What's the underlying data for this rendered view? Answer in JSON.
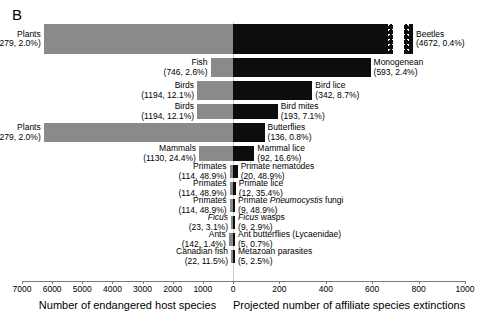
{
  "panel": {
    "letter": "B"
  },
  "chart_data": {
    "type": "bar",
    "title": "",
    "subtitle": "",
    "orientation": "horizontal-diverging",
    "xlabel_left": "Number of endangered host species",
    "xlabel_right": "Projected number of affiliate species extinctions",
    "ylabel": "",
    "grid": false,
    "legend": "none",
    "axis_left": {
      "label": "Number of endangered host species",
      "ticks": [
        7000,
        6000,
        5000,
        4000,
        3000,
        2000,
        1000,
        0
      ],
      "tick_labels": [
        "7000",
        "6000",
        "5000",
        "4000",
        "3000",
        "2000",
        "1000",
        "0"
      ],
      "range": [
        7000,
        0
      ],
      "direction": "decreasing"
    },
    "axis_right": {
      "label": "Projected number of affiliate species extinctions",
      "ticks": [
        0,
        200,
        400,
        600,
        800,
        1000
      ],
      "tick_labels": [
        "0",
        "200",
        "400",
        "600",
        "800",
        "1000"
      ],
      "range": [
        0,
        1000
      ],
      "direction": "increasing",
      "has_axis_break": true,
      "break_note": "Top bar (Beetles) is truncated with an axis break; true value 4672"
    },
    "colors": {
      "host_bar": "#8a8a8a",
      "affiliate_bar": "#0d0d0d",
      "axis": "#7b7b7b"
    },
    "rows": [
      {
        "host_name": "Plants",
        "host_value": 6279,
        "host_percent": "2.0%",
        "host_label": "Plants",
        "host_sub": "(6279, 2.0%)",
        "affiliate_name": "Beetles",
        "affiliate_value": 4672,
        "affiliate_percent": "0.4%",
        "affiliate_label": "Beetles",
        "affiliate_sub": "(4672, 0.4%)",
        "broken": true
      },
      {
        "host_name": "Fish",
        "host_value": 746,
        "host_percent": "2.6%",
        "host_label": "Fish",
        "host_sub": "(746, 2.6%)",
        "affiliate_name": "Monogenean",
        "affiliate_value": 593,
        "affiliate_percent": "2.4%",
        "affiliate_label": "Monogenean",
        "affiliate_sub": "(593, 2.4%)",
        "broken": false
      },
      {
        "host_name": "Birds",
        "host_value": 1194,
        "host_percent": "12.1%",
        "host_label": "Birds",
        "host_sub": "(1194, 12.1%)",
        "affiliate_name": "Bird lice",
        "affiliate_value": 342,
        "affiliate_percent": "8.7%",
        "affiliate_label": "Bird lice",
        "affiliate_sub": "(342, 8.7%)",
        "broken": false
      },
      {
        "host_name": "Birds",
        "host_value": 1194,
        "host_percent": "12.1%",
        "host_label": "Birds",
        "host_sub": "(1194, 12.1%)",
        "affiliate_name": "Bird mites",
        "affiliate_value": 193,
        "affiliate_percent": "7.1%",
        "affiliate_label": "Bird mites",
        "affiliate_sub": "(193, 7.1%)",
        "broken": false
      },
      {
        "host_name": "Plants",
        "host_value": 6279,
        "host_percent": "2.0%",
        "host_label": "Plants",
        "host_sub": "(6279, 2.0%)",
        "affiliate_name": "Butterflies",
        "affiliate_value": 136,
        "affiliate_percent": "0.8%",
        "affiliate_label": "Butterflies",
        "affiliate_sub": "(136, 0.8%)",
        "broken": false
      },
      {
        "host_name": "Mammals",
        "host_value": 1130,
        "host_percent": "24.4%",
        "host_label": "Mammals",
        "host_sub": "(1130, 24.4%)",
        "affiliate_name": "Mammal lice",
        "affiliate_value": 92,
        "affiliate_percent": "16.6%",
        "affiliate_label": "Mammal lice",
        "affiliate_sub": "(92, 16.6%)",
        "broken": false
      },
      {
        "host_name": "Primates",
        "host_value": 114,
        "host_percent": "48.9%",
        "host_label": "Primates",
        "host_sub": "(114, 48.9%)",
        "affiliate_name": "Primate nematodes",
        "affiliate_value": 20,
        "affiliate_percent": "48.9%",
        "affiliate_label": "Primate nematodes",
        "affiliate_sub": "(20, 48.9%)",
        "broken": false
      },
      {
        "host_name": "Primates",
        "host_value": 114,
        "host_percent": "48.9%",
        "host_label": "Primates",
        "host_sub": "(114, 48.9%)",
        "affiliate_name": "Primate lice",
        "affiliate_value": 12,
        "affiliate_percent": "35.4%",
        "affiliate_label": "Primate lice",
        "affiliate_sub": "(12, 35.4%)",
        "broken": false
      },
      {
        "host_name": "Primates",
        "host_value": 114,
        "host_percent": "48.9%",
        "host_label": "Primates",
        "host_sub": "(114, 48.9%)",
        "affiliate_name": "Primate Pneumocystis fungi",
        "affiliate_value": 9,
        "affiliate_percent": "48.9%",
        "affiliate_label_html": "Primate <em>Pneumocystis</em> fungi",
        "affiliate_sub": "(9, 48.9%)",
        "broken": false
      },
      {
        "host_name": "Ficus",
        "host_value": 23,
        "host_percent": "3.1%",
        "host_label_html": "<em>Ficus</em>",
        "host_sub": "(23, 3.1%)",
        "affiliate_name": "Ficus wasps",
        "affiliate_value": 9,
        "affiliate_percent": "2.9%",
        "affiliate_label_html": "<em>Ficus</em> wasps",
        "affiliate_sub": "(9, 2.9%)",
        "broken": false
      },
      {
        "host_name": "Ants",
        "host_value": 142,
        "host_percent": "1.4%",
        "host_label": "Ants",
        "host_sub": "(142, 1.4%)",
        "affiliate_name": "Ant butterflies (Lycaenidae)",
        "affiliate_value": 5,
        "affiliate_percent": "0.7%",
        "affiliate_label": "Ant butterflies (Lycaenidae)",
        "affiliate_sub": "(5, 0.7%)",
        "broken": false
      },
      {
        "host_name": "Canadian fish",
        "host_value": 22,
        "host_percent": "11.5%",
        "host_label": "Canadian fish",
        "host_sub": "(22, 11.5%)",
        "affiliate_name": "Metazoan parasites",
        "affiliate_value": 5,
        "affiliate_percent": "2.5%",
        "affiliate_label": "Metazoan parasites",
        "affiliate_sub": "(5, 2.5%)",
        "broken": false
      }
    ]
  }
}
